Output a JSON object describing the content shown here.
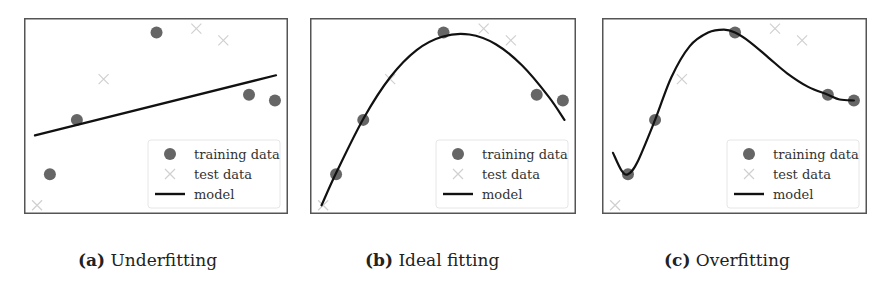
{
  "figure": {
    "legend": {
      "training": "training data",
      "test": "test data",
      "model": "model"
    },
    "colors": {
      "training": "#666666",
      "test": "#d0d0d0",
      "model": "#111111",
      "frame": "#555555"
    }
  },
  "panels": [
    {
      "id": "a",
      "label": "(a)",
      "title": "Underfitting"
    },
    {
      "id": "b",
      "label": "(b)",
      "title": "Ideal fitting"
    },
    {
      "id": "c",
      "label": "(c)",
      "title": "Overfitting"
    }
  ],
  "chart_data": [
    {
      "type": "scatter",
      "title": "(a) Underfitting",
      "xlabel": "",
      "ylabel": "",
      "xlim": [
        0,
        10
      ],
      "ylim": [
        0,
        10
      ],
      "grid": false,
      "ticks": false,
      "legend_position": "lower right",
      "series": [
        {
          "name": "training data",
          "marker": "circle",
          "x": [
            0.95,
            1.98,
            5.02,
            8.55,
            9.54
          ],
          "y": [
            2.0,
            4.8,
            9.3,
            6.1,
            5.8
          ]
        },
        {
          "name": "test data",
          "marker": "x",
          "x": [
            0.46,
            3.0,
            6.54,
            7.57
          ],
          "y": [
            0.4,
            6.9,
            9.5,
            8.9
          ]
        },
        {
          "name": "model",
          "type": "line",
          "x": [
            0.38,
            9.58
          ],
          "y": [
            4.0,
            7.1
          ]
        }
      ]
    },
    {
      "type": "scatter",
      "title": "(b) Ideal fitting",
      "xlabel": "",
      "ylabel": "",
      "xlim": [
        0,
        10
      ],
      "ylim": [
        0,
        10
      ],
      "grid": false,
      "ticks": false,
      "legend_position": "lower right",
      "series": [
        {
          "name": "training data",
          "marker": "circle",
          "x": [
            0.95,
            1.98,
            5.02,
            8.55,
            9.54
          ],
          "y": [
            2.0,
            4.8,
            9.3,
            6.1,
            5.8
          ]
        },
        {
          "name": "test data",
          "marker": "x",
          "x": [
            0.46,
            3.0,
            6.54,
            7.57
          ],
          "y": [
            0.4,
            6.9,
            9.5,
            8.9
          ]
        },
        {
          "name": "model",
          "type": "line",
          "x": [
            0.4,
            1.0,
            2.0,
            3.0,
            4.0,
            5.0,
            6.0,
            7.0,
            8.0,
            9.0,
            9.6
          ],
          "y": [
            0.4,
            2.2,
            4.9,
            7.0,
            8.4,
            9.1,
            9.2,
            8.7,
            7.6,
            6.0,
            4.8
          ]
        }
      ]
    },
    {
      "type": "scatter",
      "title": "(c) Overfitting",
      "xlabel": "",
      "ylabel": "",
      "xlim": [
        0,
        10
      ],
      "ylim": [
        0,
        10
      ],
      "grid": false,
      "ticks": false,
      "legend_position": "lower right",
      "series": [
        {
          "name": "training data",
          "marker": "circle",
          "x": [
            0.95,
            1.98,
            5.02,
            8.55,
            9.54
          ],
          "y": [
            2.0,
            4.8,
            9.3,
            6.1,
            5.8
          ]
        },
        {
          "name": "test data",
          "marker": "x",
          "x": [
            0.46,
            3.0,
            6.54,
            7.57
          ],
          "y": [
            0.4,
            6.9,
            9.5,
            8.9
          ]
        },
        {
          "name": "model",
          "type": "line",
          "x": [
            0.38,
            0.7,
            0.95,
            1.3,
            1.98,
            2.6,
            3.3,
            4.0,
            4.6,
            5.02,
            5.6,
            6.3,
            7.0,
            7.8,
            8.55,
            9.0,
            9.54
          ],
          "y": [
            3.1,
            2.2,
            2.0,
            2.6,
            4.8,
            7.0,
            8.6,
            9.3,
            9.45,
            9.3,
            8.8,
            8.0,
            7.2,
            6.5,
            6.1,
            5.85,
            5.8
          ]
        }
      ]
    }
  ]
}
